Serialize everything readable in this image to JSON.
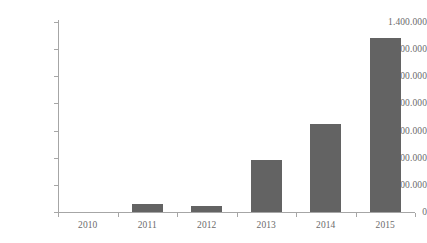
{
  "chart_data": {
    "type": "bar",
    "title": "",
    "subtitle": "",
    "xlabel": "",
    "ylabel": "",
    "categories": [
      "2010",
      "2011",
      "2012",
      "2013",
      "2014",
      "2015"
    ],
    "values": [
      0,
      60000,
      45000,
      380000,
      650000,
      1280000
    ],
    "ylim": [
      0,
      1400000
    ],
    "ytick_values": [
      0,
      200000,
      400000,
      600000,
      800000,
      1000000,
      1200000,
      1400000
    ],
    "ytick_labels": [
      "0",
      "200.000",
      "400.000",
      "600.000",
      "800.000",
      "1.000.000",
      "1.200.000",
      "1.400.000"
    ],
    "grid": false,
    "legend": false,
    "legend_position": "none",
    "number_format": "period-thousands-separator",
    "colors": {
      "bar": "#636363",
      "axis": "#a6a6a6",
      "tick_label": "#6b6b6b",
      "background": "#ffffff"
    }
  }
}
